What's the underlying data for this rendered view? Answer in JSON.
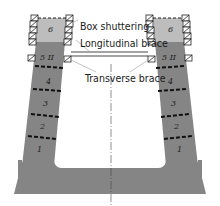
{
  "labels": {
    "box_shuttering": "Box shuttering",
    "longitudinal_brace": "Longitudinal brace",
    "transverse_brace": "Transverse brace"
  },
  "left_wall": {
    "segments": [
      "6",
      "5 II",
      "4",
      "3",
      "2",
      "1"
    ]
  },
  "right_wall": {
    "segments": [
      "6",
      "5 II",
      "4",
      "3",
      "2",
      "1"
    ]
  },
  "colors": {
    "concrete": "#858585",
    "fresh_pour": "#bdbdbd",
    "joint": "#111111",
    "shutter_box": "#ffffff",
    "leader_line": "#9a9a9a"
  }
}
